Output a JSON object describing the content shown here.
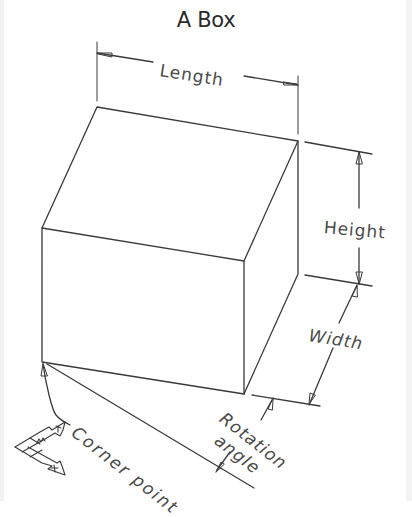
{
  "diagram": {
    "title": "A Box",
    "labels": {
      "length": "Length",
      "height": "Height",
      "width": "Width",
      "rotation_angle_line1": "Rotation",
      "rotation_angle_line2": "angle",
      "corner_point": "Corner point"
    },
    "ucs_icon": {
      "x_axis": "X",
      "y_axis": "Y",
      "origin_marker": "W"
    },
    "colors": {
      "line": "#3a3a3a",
      "text": "#4a4a4a",
      "background": "#ffffff",
      "border": "#f3f3f3"
    },
    "vertices": {
      "corner_point": [
        42,
        362
      ],
      "front_bottom_right": [
        244,
        394
      ],
      "front_top_left": [
        42,
        228
      ],
      "front_top_right": [
        244,
        261
      ],
      "back_top_left": [
        97,
        107
      ],
      "back_top_right": [
        298,
        141
      ],
      "back_bottom_right": [
        298,
        274
      ]
    }
  }
}
